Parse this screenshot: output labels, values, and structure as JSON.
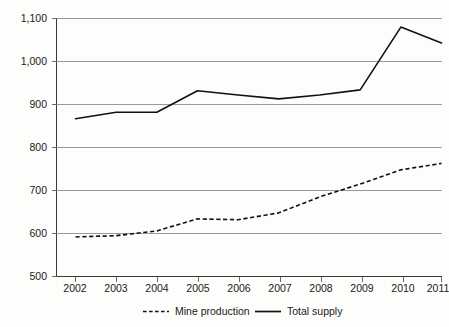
{
  "chart_data": {
    "type": "line",
    "title": "",
    "subtitle": "",
    "xlabel": "",
    "ylabel": "",
    "categories": [
      "2002",
      "2003",
      "2004",
      "2005",
      "2006",
      "2007",
      "2008",
      "2009",
      "2010",
      "2011"
    ],
    "x": [
      2002,
      2003,
      2004,
      2005,
      2006,
      2007,
      2008,
      2009,
      2010,
      2011
    ],
    "ylim": [
      500,
      1100
    ],
    "ytick_values": [
      500,
      600,
      700,
      800,
      900,
      1000,
      1100
    ],
    "ytick_labels": [
      "500",
      "600",
      "700",
      "800",
      "900",
      "1,000",
      "1,100"
    ],
    "grid": true,
    "grid_axis": "y",
    "legend_position": "bottom-center",
    "series": [
      {
        "name": "Mine production",
        "style": "dashed",
        "color": "#111111",
        "values": [
          592,
          595,
          606,
          634,
          632,
          648,
          685,
          715,
          748,
          763
        ]
      },
      {
        "name": "Total supply",
        "style": "solid",
        "color": "#111111",
        "values": [
          867,
          882,
          882,
          932,
          922,
          913,
          922,
          934,
          1080,
          1043
        ]
      }
    ],
    "annotations": []
  },
  "axis": {
    "y_labels": [
      "1,100",
      "1,000",
      "900",
      "800",
      "700",
      "600",
      "500"
    ],
    "x_labels": [
      "2002",
      "2003",
      "2004",
      "2005",
      "2006",
      "2007",
      "2008",
      "2009",
      "2010",
      "2011"
    ]
  },
  "legend": {
    "entries": [
      {
        "label": "Mine production",
        "style": "dashed"
      },
      {
        "label": "Total supply",
        "style": "solid"
      }
    ],
    "mine_label": "Mine production",
    "total_label": "Total supply"
  },
  "colors": {
    "background": "#fdfdfb",
    "gridline": "#9a9a9a",
    "axis": "#3a3a3a",
    "series": "#111111",
    "text": "#1a1a1a"
  }
}
